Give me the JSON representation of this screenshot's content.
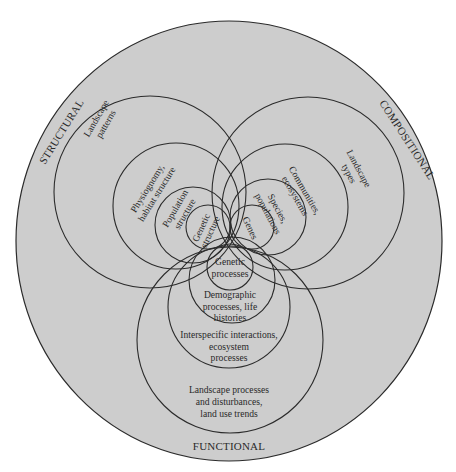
{
  "diagram": {
    "type": "nested-venn",
    "colors": {
      "fill": "#cdcdcd",
      "stroke": "#2b2b2b",
      "text": "#2a2a2a",
      "background": "#ffffff"
    },
    "attributes": {
      "structural": {
        "title": "STRUCTURAL",
        "levels": [
          [
            "Landscape",
            "patterns"
          ],
          [
            "Physiognomy,",
            "habitat structure"
          ],
          [
            "Population",
            "structure"
          ],
          [
            "Genetic",
            "structure"
          ]
        ]
      },
      "compositional": {
        "title": "COMPOSITIONAL",
        "levels": [
          [
            "Landscape",
            "types"
          ],
          [
            "Communities,",
            "ecosystems"
          ],
          [
            "Species,",
            "populations"
          ],
          [
            "Genes"
          ]
        ]
      },
      "functional": {
        "title": "FUNCTIONAL",
        "levels": [
          [
            "Landscape processes",
            "and disturbances,",
            "land use trends"
          ],
          [
            "Interspecific interactions,",
            "ecosystem",
            "processes"
          ],
          [
            "Demographic",
            "processes, life",
            "histories"
          ],
          [
            "Genetic",
            "processes"
          ]
        ]
      }
    }
  }
}
